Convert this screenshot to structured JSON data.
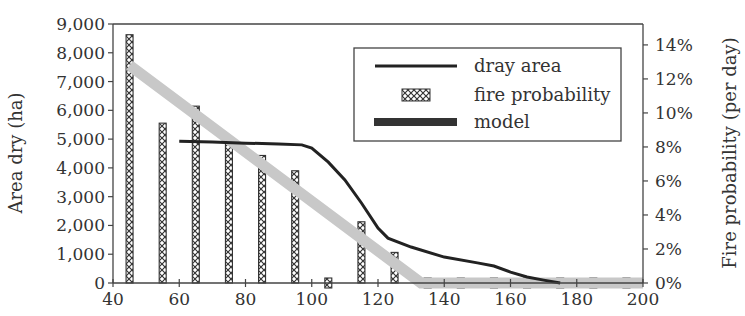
{
  "chart_data": {
    "type": "bar",
    "title": "",
    "xlabel": "",
    "ylabel": "Area dry (ha)",
    "y2label": "Fire probability (per day)",
    "xlim": [
      40,
      200
    ],
    "ylim": [
      0,
      9000
    ],
    "y2lim": [
      0,
      0.1523
    ],
    "x_ticks": [
      40,
      60,
      80,
      100,
      120,
      140,
      160,
      180,
      200
    ],
    "x_tick_labels": [
      "40",
      "60",
      "80",
      "100",
      "120",
      "140",
      "160",
      "180",
      "200"
    ],
    "y_ticks": [
      0,
      1000,
      2000,
      3000,
      4000,
      5000,
      6000,
      7000,
      8000,
      9000
    ],
    "y_tick_labels": [
      "0",
      "1,000",
      "2,000",
      "3,000",
      "4,000",
      "5,000",
      "6,000",
      "7,000",
      "8,000",
      "9,000"
    ],
    "y2_ticks": [
      0,
      0.02,
      0.04,
      0.06,
      0.08,
      0.1,
      0.12,
      0.14
    ],
    "y2_tick_labels": [
      "0%",
      "2%",
      "4%",
      "6%",
      "8%",
      "10%",
      "12%",
      "14%"
    ],
    "grid": false,
    "legend_position": "upper right (inside)",
    "series": [
      {
        "name": "dray area",
        "type": "line",
        "axis": "left",
        "color": "#222222",
        "x": [
          60,
          70,
          80,
          90,
          97,
          100,
          105,
          110,
          115,
          120,
          123,
          130,
          140,
          150,
          155,
          160,
          165,
          170,
          175
        ],
        "values": [
          4930,
          4900,
          4860,
          4830,
          4800,
          4690,
          4200,
          3580,
          2780,
          1910,
          1560,
          1250,
          900,
          700,
          590,
          380,
          210,
          100,
          0
        ]
      },
      {
        "name": "fire probability",
        "type": "bar",
        "axis": "right",
        "pattern": "crosshatch",
        "x": [
          45,
          55,
          65,
          75,
          85,
          95,
          105,
          115,
          125,
          135,
          145,
          155,
          165,
          175,
          185,
          195
        ],
        "values": [
          0.146,
          0.094,
          0.104,
          0.086,
          0.075,
          0.066,
          0.003,
          0.036,
          0.018,
          0.003,
          0.003,
          0.003,
          0.003,
          0.003,
          0.003,
          0.003
        ]
      },
      {
        "name": "model",
        "type": "line",
        "axis": "right",
        "color": "#c8c8c8",
        "x": [
          45,
          133,
          200
        ],
        "values": [
          0.128,
          0.0,
          0.0
        ]
      }
    ]
  },
  "legend": {
    "items": [
      {
        "label": "dray area"
      },
      {
        "label": "fire probability"
      },
      {
        "label": "model"
      }
    ]
  }
}
